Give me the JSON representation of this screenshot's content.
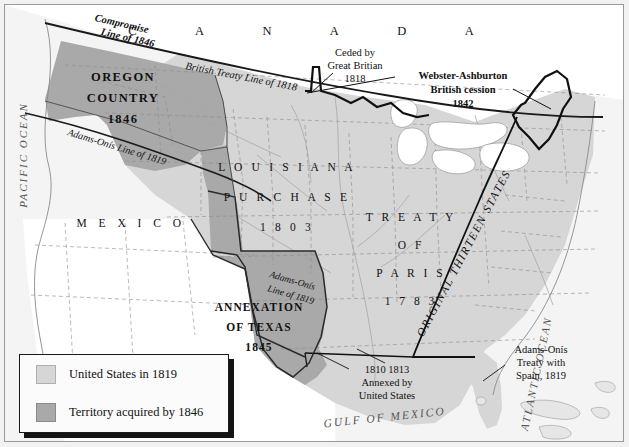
{
  "map": {
    "title": "United States Territorial Expansion to 1846",
    "colors": {
      "us_1819": "#d6d6d6",
      "acquired_1846": "#a9a9a9",
      "foreign": "#ffffff",
      "ocean": "#f4f4f4",
      "border_heavy": "#111111",
      "border_state": "#8a8a8a",
      "frame": "#9a9a9a"
    },
    "countries": [
      {
        "name": "canada",
        "label": "C  A  N  A  D  A"
      },
      {
        "name": "mexico",
        "label": "M E X I C O"
      }
    ],
    "oceans": [
      {
        "name": "pacific-ocean",
        "label": "PACIFIC OCEAN"
      },
      {
        "name": "atlantic-ocean",
        "label": "ATLANTIC OCEAN"
      },
      {
        "name": "gulf-of-mexico",
        "label": "GULF OF MEXICO"
      }
    ],
    "territories": [
      {
        "name": "oregon-country",
        "line1": "OREGON",
        "line2": "COUNTRY",
        "line3": "1846",
        "fill": "acquired_1846"
      },
      {
        "name": "louisiana-purchase",
        "line1": "L O U I S I A N A",
        "line2": "P U R C H A S E",
        "line3": "1 8 0 3",
        "fill": "us_1819"
      },
      {
        "name": "treaty-of-paris",
        "line1": "T R E A T Y",
        "line2": "O F",
        "line3": "P A R I S",
        "line4": "1 7 8 3",
        "fill": "us_1819"
      },
      {
        "name": "annexation-of-texas",
        "line1": "ANNEXATION",
        "line2": "OF TEXAS",
        "line3": "1845",
        "fill": "acquired_1846"
      },
      {
        "name": "original-thirteen-states",
        "label": "ORIGINAL THIRTEEN STATES",
        "fill": "us_1819"
      }
    ],
    "boundary_lines": [
      {
        "name": "compromise-line-1846",
        "line1": "Compromise",
        "line2": "Line of 1846"
      },
      {
        "name": "british-treaty-line-1818",
        "label": "British Treaty Line of 1818"
      },
      {
        "name": "adams-onis-line-1819-northwest",
        "label": "Adams-Onís Line of 1819"
      },
      {
        "name": "adams-onis-line-1819-texas",
        "line1": "Adams-Onís",
        "line2": "Line of 1819"
      }
    ],
    "callouts": [
      {
        "name": "ceded-by-great-britain",
        "line1": "Ceded by",
        "line2": "Great Britian",
        "line3": "1818"
      },
      {
        "name": "webster-ashburton-cession",
        "line1": "Webster-Ashburton",
        "line2": "British cession",
        "line3": "1842"
      },
      {
        "name": "annexed-by-united-states",
        "line1": "1810   1813",
        "line2": "Annexed by",
        "line3": "United States"
      },
      {
        "name": "adams-onis-treaty-with-spain",
        "line1": "Adams-Onís",
        "line2": "Treaty with",
        "line3": "Spain, 1819"
      }
    ]
  },
  "legend": {
    "items": [
      {
        "name": "legend-item-us-1819",
        "label": "United States in 1819",
        "color": "#d6d6d6"
      },
      {
        "name": "legend-item-acquired-1846",
        "label": "Territory acquired by 1846",
        "color": "#a9a9a9"
      }
    ]
  }
}
